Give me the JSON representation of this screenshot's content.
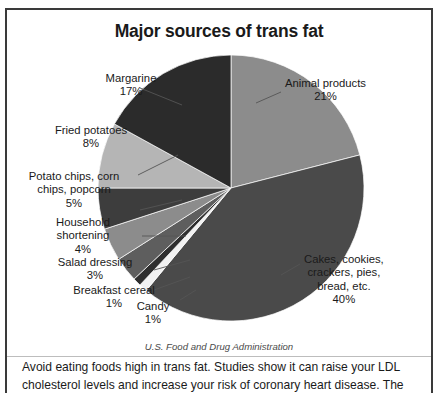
{
  "chart_data": {
    "type": "pie",
    "title": "Major sources of trans fat",
    "source": "U.S. Food and Drug Administration",
    "unit": "%",
    "start_angle_deg": 0,
    "direction": "clockwise",
    "categories": [
      "Animal products",
      "Cakes, cookies, crackers, pies, bread, etc.",
      "Candy",
      "Breakfast cereal",
      "Salad dressing",
      "Household shortening",
      "Potato chips, corn chips, popcorn",
      "Fried potatoes",
      "Margarine"
    ],
    "values": [
      21,
      40,
      1,
      1,
      3,
      4,
      5,
      8,
      17
    ],
    "colors": [
      "#8c8c8c",
      "#4a4a4a",
      "#f2f2f2",
      "#2e2e2e",
      "#5e5e5e",
      "#8c8c8c",
      "#3d3d3d",
      "#b5b5b5",
      "#2b2b2b"
    ],
    "slices": [
      {
        "label": "Animal products",
        "value": 21,
        "value_text": "21%",
        "color": "#8c8c8c"
      },
      {
        "label": "Cakes, cookies, crackers, pies, bread, etc.",
        "value": 40,
        "value_text": "40%",
        "color": "#4a4a4a"
      },
      {
        "label": "Candy",
        "value": 1,
        "value_text": "1%",
        "color": "#f2f2f2"
      },
      {
        "label": "Breakfast cereal",
        "value": 1,
        "value_text": "1%",
        "color": "#2e2e2e"
      },
      {
        "label": "Salad dressing",
        "value": 3,
        "value_text": "3%",
        "color": "#5e5e5e"
      },
      {
        "label": "Household shortening",
        "value": 4,
        "value_text": "4%",
        "color": "#8c8c8c"
      },
      {
        "label": "Potato chips, corn chips, popcorn",
        "value": 5,
        "value_text": "5%",
        "color": "#3d3d3d"
      },
      {
        "label": "Fried potatoes",
        "value": 8,
        "value_text": "8%",
        "color": "#b5b5b5"
      },
      {
        "label": "Margarine",
        "value": 17,
        "value_text": "17%",
        "color": "#2b2b2b"
      }
    ],
    "legend": "none",
    "grid": false
  },
  "labels": {
    "animal_products": {
      "line1": "Animal products",
      "pct": "21%"
    },
    "cakes": {
      "line1": "Cakes, cookies,",
      "line2": "crackers, pies,",
      "line3": "bread, etc.",
      "pct": "40%"
    },
    "candy": {
      "line1": "Candy",
      "pct": "1%"
    },
    "breakfast_cereal": {
      "line1": "Breakfast cereal",
      "pct": "1%"
    },
    "salad_dressing": {
      "line1": "Salad dressing",
      "pct": "3%"
    },
    "household_shortening": {
      "line1": "Household",
      "line2": "shortening",
      "pct": "4%"
    },
    "potato_chips": {
      "line1": "Potato chips, corn",
      "line2": "chips, popcorn",
      "pct": "5%"
    },
    "fried_potatoes": {
      "line1": "Fried potatoes",
      "pct": "8%"
    },
    "margarine": {
      "line1": "Margarine",
      "pct": "17%"
    }
  },
  "caption": {
    "text": "Avoid eating foods high in trans fat. Studies show it can raise your LDL cholesterol levels and increase your risk of coronary heart disease. The"
  }
}
